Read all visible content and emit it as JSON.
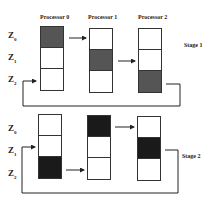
{
  "diagram": {
    "processors": [
      "Processor 0",
      "Processor 1",
      "Processor 2"
    ],
    "rows": [
      {
        "base": "Z",
        "sub": "0"
      },
      {
        "base": "Z",
        "sub": "1"
      },
      {
        "base": "Z",
        "sub": "2"
      }
    ],
    "stages": [
      {
        "label": "Stage 1",
        "filled": [
          0,
          1,
          2
        ],
        "fill": "hatched"
      },
      {
        "label": "Stage 2",
        "filled": [
          2,
          0,
          1
        ],
        "fill": "solid"
      }
    ]
  }
}
